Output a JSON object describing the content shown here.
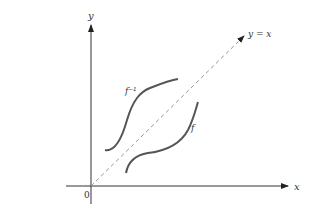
{
  "diagram": {
    "labels": {
      "y_axis": "y",
      "x_axis": "x",
      "origin": "0",
      "diagonal": "y = x",
      "f_inverse": "f⁻¹",
      "f": "f"
    },
    "colors": {
      "axis": "#222222",
      "curve": "#555555",
      "dashed": "#999999"
    }
  }
}
